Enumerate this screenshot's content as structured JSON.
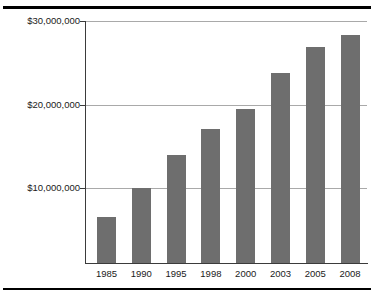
{
  "figure": {
    "top_rule": "",
    "bottom_rule": ""
  },
  "chart_data": {
    "type": "bar",
    "title": "",
    "xlabel": "",
    "ylabel": "",
    "categories": [
      "1985",
      "1990",
      "1995",
      "1998",
      "2000",
      "2003",
      "2005",
      "2008"
    ],
    "values": [
      5500000,
      9000000,
      12900000,
      16000000,
      18400000,
      22800000,
      25900000,
      27300000
    ],
    "value_labels": [
      "",
      "",
      "",
      "",
      "",
      "",
      "",
      ""
    ],
    "ylim": [
      0,
      30000000
    ],
    "yticks": [
      10000000,
      20000000,
      30000000
    ],
    "ytick_labels": [
      "$10,000,000",
      "$20,000,000",
      "$30,000,000"
    ],
    "grid": true,
    "legend": "none",
    "bar_color": "#6e6e6e",
    "grid_color": "#a9a9a9",
    "axis_color": "#3b3b3b"
  }
}
